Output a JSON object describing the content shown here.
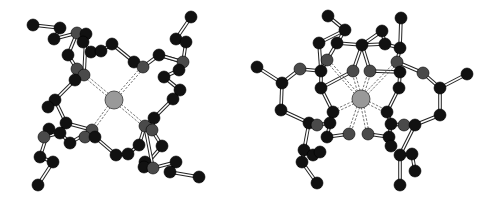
{
  "figure": {
    "background": "#ffffff",
    "colors": {
      "carbon": "#111111",
      "heteroatom": "#4a4a4a",
      "metal": "#999999",
      "bond_outline": "#222222",
      "bond_fill": "#ffffff"
    },
    "radii": {
      "atom": 6,
      "metal": 9
    },
    "structures": [
      {
        "name": "left-view",
        "metal": [
          114,
          100
        ],
        "atoms": [
          [
            33,
            25,
            "C"
          ],
          [
            60,
            28,
            "C"
          ],
          [
            54,
            39,
            "C"
          ],
          [
            77,
            33,
            "N"
          ],
          [
            86,
            34,
            "C"
          ],
          [
            83,
            42,
            "C"
          ],
          [
            68,
            55,
            "C"
          ],
          [
            91,
            52,
            "C"
          ],
          [
            101,
            51,
            "C"
          ],
          [
            112,
            44,
            "C"
          ],
          [
            77,
            69,
            "N"
          ],
          [
            84,
            75,
            "N"
          ],
          [
            75,
            80,
            "C"
          ],
          [
            191,
            17,
            "C"
          ],
          [
            176,
            39,
            "C"
          ],
          [
            186,
            42,
            "C"
          ],
          [
            183,
            62,
            "N"
          ],
          [
            179,
            70,
            "C"
          ],
          [
            134,
            62,
            "C"
          ],
          [
            143,
            67,
            "N"
          ],
          [
            159,
            55,
            "C"
          ],
          [
            164,
            77,
            "C"
          ],
          [
            180,
            90,
            "C"
          ],
          [
            173,
            99,
            "C"
          ],
          [
            55,
            100,
            "C"
          ],
          [
            48,
            107,
            "C"
          ],
          [
            66,
            123,
            "C"
          ],
          [
            49,
            129,
            "C"
          ],
          [
            44,
            137,
            "N"
          ],
          [
            60,
            133,
            "C"
          ],
          [
            70,
            143,
            "C"
          ],
          [
            92,
            130,
            "N"
          ],
          [
            85,
            137,
            "N"
          ],
          [
            95,
            137,
            "C"
          ],
          [
            40,
            157,
            "C"
          ],
          [
            53,
            162,
            "C"
          ],
          [
            38,
            185,
            "C"
          ],
          [
            116,
            155,
            "C"
          ],
          [
            128,
            154,
            "C"
          ],
          [
            139,
            145,
            "C"
          ],
          [
            145,
            126,
            "N"
          ],
          [
            154,
            118,
            "C"
          ],
          [
            152,
            130,
            "N"
          ],
          [
            162,
            146,
            "C"
          ],
          [
            145,
            162,
            "C"
          ],
          [
            144,
            167,
            "C"
          ],
          [
            153,
            168,
            "N"
          ],
          [
            176,
            162,
            "C"
          ],
          [
            170,
            172,
            "C"
          ],
          [
            199,
            177,
            "C"
          ]
        ],
        "bonds": [
          [
            0,
            1
          ],
          [
            1,
            2
          ],
          [
            2,
            3
          ],
          [
            3,
            4
          ],
          [
            3,
            5
          ],
          [
            5,
            7
          ],
          [
            3,
            6
          ],
          [
            6,
            10
          ],
          [
            4,
            11
          ],
          [
            10,
            12
          ],
          [
            7,
            8
          ],
          [
            8,
            9
          ],
          [
            9,
            18
          ],
          [
            11,
            10
          ],
          [
            12,
            24
          ],
          [
            24,
            25
          ],
          [
            24,
            26
          ],
          [
            13,
            14
          ],
          [
            14,
            15
          ],
          [
            15,
            16
          ],
          [
            16,
            17
          ],
          [
            16,
            20
          ],
          [
            18,
            19
          ],
          [
            19,
            20
          ],
          [
            20,
            16
          ],
          [
            17,
            21
          ],
          [
            21,
            22
          ],
          [
            22,
            23
          ],
          [
            23,
            41
          ],
          [
            26,
            31
          ],
          [
            26,
            29
          ],
          [
            27,
            28
          ],
          [
            28,
            29
          ],
          [
            29,
            30
          ],
          [
            30,
            31
          ],
          [
            31,
            32
          ],
          [
            32,
            33
          ],
          [
            33,
            37
          ],
          [
            27,
            34
          ],
          [
            34,
            35
          ],
          [
            35,
            36
          ],
          [
            37,
            38
          ],
          [
            38,
            39
          ],
          [
            39,
            40
          ],
          [
            40,
            41
          ],
          [
            41,
            42
          ],
          [
            42,
            43
          ],
          [
            43,
            45
          ],
          [
            40,
            46
          ],
          [
            44,
            46
          ],
          [
            46,
            47
          ],
          [
            47,
            48
          ],
          [
            48,
            49
          ]
        ],
        "coordination": [
          [
            84,
            75
          ],
          [
            143,
            67
          ],
          [
            145,
            126
          ],
          [
            92,
            130
          ]
        ]
      },
      {
        "name": "right-view",
        "metal": [
          361,
          99
        ],
        "atoms": [
          [
            328,
            16,
            "C"
          ],
          [
            345,
            30,
            "C"
          ],
          [
            319,
            43,
            "C"
          ],
          [
            337,
            43,
            "C"
          ],
          [
            362,
            45,
            "C"
          ],
          [
            385,
            44,
            "C"
          ],
          [
            400,
            48,
            "C"
          ],
          [
            401,
            18,
            "C"
          ],
          [
            382,
            31,
            "C"
          ],
          [
            327,
            60,
            "N"
          ],
          [
            321,
            71,
            "C"
          ],
          [
            353,
            71,
            "N"
          ],
          [
            370,
            71,
            "N"
          ],
          [
            397,
            62,
            "N"
          ],
          [
            400,
            72,
            "C"
          ],
          [
            321,
            88,
            "C"
          ],
          [
            399,
            88,
            "C"
          ],
          [
            257,
            67,
            "C"
          ],
          [
            300,
            69,
            "N"
          ],
          [
            282,
            83,
            "C"
          ],
          [
            423,
            73,
            "N"
          ],
          [
            440,
            88,
            "C"
          ],
          [
            467,
            74,
            "C"
          ],
          [
            281,
            110,
            "C"
          ],
          [
            440,
            115,
            "C"
          ],
          [
            333,
            112,
            "C"
          ],
          [
            387,
            112,
            "C"
          ],
          [
            309,
            123,
            "C"
          ],
          [
            317,
            125,
            "N"
          ],
          [
            330,
            123,
            "C"
          ],
          [
            327,
            137,
            "C"
          ],
          [
            349,
            134,
            "N"
          ],
          [
            368,
            134,
            "N"
          ],
          [
            391,
            124,
            "C"
          ],
          [
            404,
            125,
            "N"
          ],
          [
            415,
            125,
            "C"
          ],
          [
            389,
            137,
            "C"
          ],
          [
            391,
            146,
            "C"
          ],
          [
            304,
            150,
            "C"
          ],
          [
            313,
            155,
            "C"
          ],
          [
            320,
            152,
            "C"
          ],
          [
            302,
            162,
            "C"
          ],
          [
            317,
            183,
            "C"
          ],
          [
            400,
            155,
            "C"
          ],
          [
            412,
            154,
            "C"
          ],
          [
            415,
            171,
            "C"
          ],
          [
            400,
            185,
            "C"
          ]
        ],
        "bonds": [
          [
            0,
            1
          ],
          [
            1,
            2
          ],
          [
            1,
            3
          ],
          [
            3,
            4
          ],
          [
            4,
            5
          ],
          [
            5,
            6
          ],
          [
            6,
            7
          ],
          [
            5,
            8
          ],
          [
            8,
            4
          ],
          [
            2,
            10
          ],
          [
            3,
            9
          ],
          [
            4,
            11
          ],
          [
            4,
            12
          ],
          [
            6,
            13
          ],
          [
            9,
            10
          ],
          [
            10,
            15
          ],
          [
            13,
            14
          ],
          [
            14,
            16
          ],
          [
            11,
            15
          ],
          [
            12,
            14
          ],
          [
            17,
            19
          ],
          [
            18,
            19
          ],
          [
            18,
            10
          ],
          [
            19,
            23
          ],
          [
            23,
            27
          ],
          [
            13,
            20
          ],
          [
            20,
            21
          ],
          [
            21,
            22
          ],
          [
            21,
            24
          ],
          [
            24,
            35
          ],
          [
            15,
            25
          ],
          [
            16,
            26
          ],
          [
            27,
            28
          ],
          [
            28,
            29
          ],
          [
            29,
            30
          ],
          [
            30,
            31
          ],
          [
            25,
            29
          ],
          [
            27,
            38
          ],
          [
            38,
            39
          ],
          [
            39,
            40
          ],
          [
            38,
            41
          ],
          [
            41,
            42
          ],
          [
            32,
            36
          ],
          [
            36,
            33
          ],
          [
            33,
            34
          ],
          [
            34,
            35
          ],
          [
            26,
            33
          ],
          [
            35,
            43
          ],
          [
            43,
            44
          ],
          [
            44,
            45
          ],
          [
            43,
            46
          ]
        ],
        "coordination": [
          [
            327,
            60
          ],
          [
            353,
            71
          ],
          [
            370,
            71
          ],
          [
            397,
            62
          ],
          [
            333,
            112
          ],
          [
            387,
            112
          ],
          [
            349,
            134
          ],
          [
            368,
            134
          ]
        ]
      }
    ]
  }
}
